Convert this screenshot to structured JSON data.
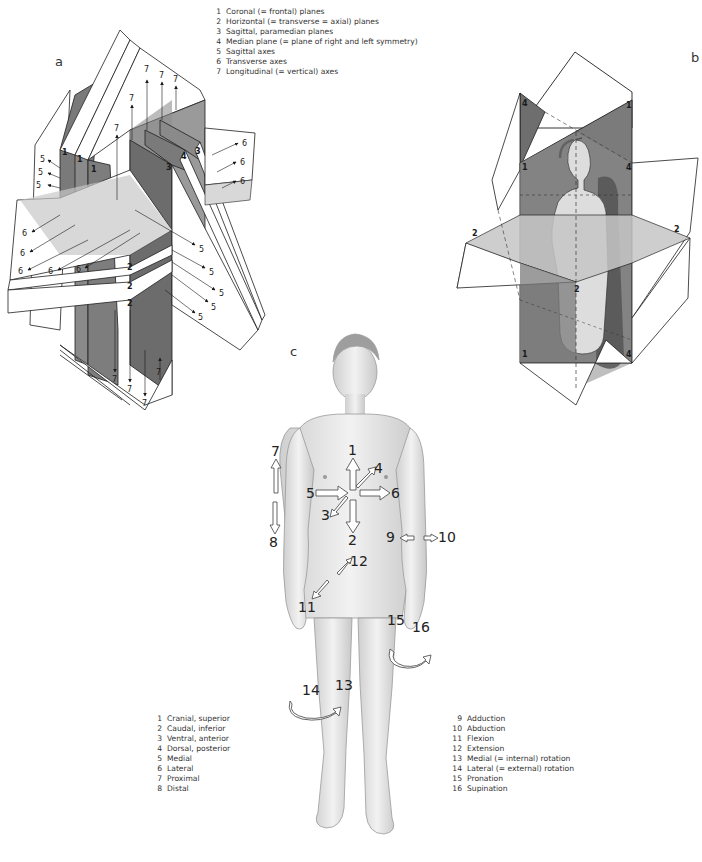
{
  "panels": {
    "a": {
      "label": "a"
    },
    "b": {
      "label": "b"
    },
    "c": {
      "label": "c"
    }
  },
  "legend_planes_axes": [
    {
      "num": "1",
      "text": "Coronal (= frontal) planes"
    },
    {
      "num": "2",
      "text": "Horizontal (= transverse = axial) planes"
    },
    {
      "num": "3",
      "text": "Sagittal, paramedian planes"
    },
    {
      "num": "4",
      "text": "Median plane (= plane of right and left symmetry)"
    },
    {
      "num": "5",
      "text": "Sagittal axes"
    },
    {
      "num": "6",
      "text": "Transverse axes"
    },
    {
      "num": "7",
      "text": "Longitudinal (= vertical) axes"
    }
  ],
  "legend_directions": [
    {
      "num": "1",
      "text": "Cranial, superior"
    },
    {
      "num": "2",
      "text": "Caudal, inferior"
    },
    {
      "num": "3",
      "text": "Ventral, anterior"
    },
    {
      "num": "4",
      "text": "Dorsal, posterior"
    },
    {
      "num": "5",
      "text": "Medial"
    },
    {
      "num": "6",
      "text": "Lateral"
    },
    {
      "num": "7",
      "text": "Proximal"
    },
    {
      "num": "8",
      "text": "Distal"
    }
  ],
  "legend_movements": [
    {
      "num": "9",
      "text": "Adduction"
    },
    {
      "num": "10",
      "text": "Abduction"
    },
    {
      "num": "11",
      "text": "Flexion"
    },
    {
      "num": "12",
      "text": "Extension"
    },
    {
      "num": "13",
      "text": "Medial (= internal) rotation"
    },
    {
      "num": "14",
      "text": "Lateral (= external) rotation"
    },
    {
      "num": "15",
      "text": "Pronation"
    },
    {
      "num": "16",
      "text": "Supination"
    }
  ],
  "diagram_a_labels": {
    "coronal": "1",
    "horizontal": "2",
    "sagittal": "3",
    "median": "4",
    "sagittal_axis": "5",
    "transverse_axis": "6",
    "longitudinal_axis": "7"
  },
  "diagram_b_labels": {
    "coronal": "1",
    "horizontal": "2",
    "median": "4"
  },
  "diagram_c_labels": {
    "l1": "1",
    "l2": "2",
    "l3": "3",
    "l4": "4",
    "l5": "5",
    "l6": "6",
    "l7": "7",
    "l8": "8",
    "l9": "9",
    "l10": "10",
    "l11": "11",
    "l12": "12",
    "l13": "13",
    "l14": "14",
    "l15": "15",
    "l16": "16"
  },
  "colors": {
    "plane_dark": "#6f6f6f",
    "plane_mid": "#8a8a8a",
    "plane_light": "#c9c9c9",
    "plane_white": "#ffffff",
    "outline": "#1e1e1e",
    "skin": "#e4e4e4"
  }
}
